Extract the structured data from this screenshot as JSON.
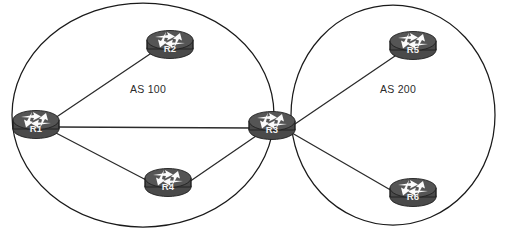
{
  "diagram": {
    "canvas": {
      "width": 505,
      "height": 230
    },
    "background_color": "#ffffff",
    "line_color": "#2b2b2b",
    "router_body_color": "#4a4a4a",
    "router_top_color": "#555555",
    "router_label_color": "#f2f2f2"
  },
  "clouds": [
    {
      "id": "as100",
      "label": "AS 100",
      "label_x": 148,
      "label_y": 93,
      "cx": 143,
      "cy": 115,
      "rx": 131,
      "ry": 112
    },
    {
      "id": "as200",
      "label": "AS 200",
      "label_x": 398,
      "label_y": 93,
      "cx": 393,
      "cy": 115,
      "rx": 102,
      "ry": 110
    }
  ],
  "routers": [
    {
      "id": "r1",
      "label": "R1",
      "x": 36,
      "y": 125,
      "icon": "router-icon"
    },
    {
      "id": "r2",
      "label": "R2",
      "x": 170,
      "y": 45,
      "icon": "router-icon"
    },
    {
      "id": "r3",
      "label": "R3",
      "x": 272,
      "y": 126,
      "icon": "router-icon"
    },
    {
      "id": "r4",
      "label": "R4",
      "x": 168,
      "y": 183,
      "icon": "router-icon"
    },
    {
      "id": "r5",
      "label": "R5",
      "x": 413,
      "y": 46,
      "icon": "router-icon"
    },
    {
      "id": "r6",
      "label": "R6",
      "x": 413,
      "y": 193,
      "icon": "router-icon"
    }
  ],
  "links": [
    {
      "id": "r1-r2",
      "from": "R1",
      "to": "R2",
      "x1": 55,
      "y1": 118,
      "x2": 153,
      "y2": 52
    },
    {
      "id": "r1-r3",
      "from": "R1",
      "to": "R3",
      "x1": 57,
      "y1": 127,
      "x2": 252,
      "y2": 128
    },
    {
      "id": "r1-r4",
      "from": "R1",
      "to": "R4",
      "x1": 56,
      "y1": 133,
      "x2": 150,
      "y2": 182
    },
    {
      "id": "r4-r3",
      "from": "R4",
      "to": "R3",
      "x1": 189,
      "y1": 182,
      "x2": 256,
      "y2": 136
    },
    {
      "id": "r3-r5",
      "from": "R3",
      "to": "R5",
      "x1": 292,
      "y1": 126,
      "x2": 395,
      "y2": 56
    },
    {
      "id": "r3-r6",
      "from": "R3",
      "to": "R6",
      "x1": 292,
      "y1": 133,
      "x2": 394,
      "y2": 192
    }
  ]
}
